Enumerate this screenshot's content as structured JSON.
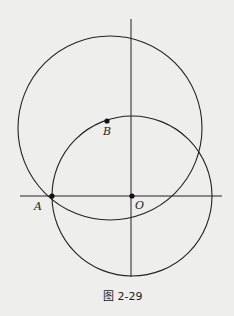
{
  "figure": {
    "caption": "图 2-29",
    "points": {
      "A": {
        "label": "A",
        "x": 52,
        "y": 196
      },
      "B": {
        "label": "B",
        "x": 107,
        "y": 121
      },
      "O": {
        "label": "O",
        "x": 132,
        "y": 196
      }
    },
    "circles": [
      {
        "name": "large-circle",
        "cx": 110,
        "cy": 128,
        "r": 92
      },
      {
        "name": "small-circle-centered-O",
        "cx": 132,
        "cy": 196,
        "r": 80
      }
    ],
    "axes": {
      "horizontal": {
        "x1": 20,
        "x2": 222,
        "y": 196
      },
      "vertical": {
        "x": 131,
        "y1": 19,
        "y2": 277
      }
    },
    "colors": {
      "stroke": "#222222",
      "background": "#eeeeec"
    }
  }
}
